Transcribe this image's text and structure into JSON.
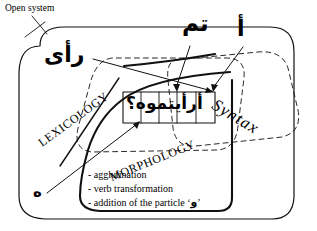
{
  "diagram": {
    "title_label": "Open system",
    "domains": {
      "lexicology": "LEXICOLOGY",
      "morphology": "MORPHOLOGY",
      "syntax": "Syntax"
    },
    "center_box": {
      "phrase": "أرأيتموه؟",
      "cells": [
        "؟",
        "ه",
        "مو",
        "أيت",
        "أر"
      ]
    },
    "arabic_annotations": {
      "ra_a": "رأى",
      "tamma": "تم",
      "alif": "أ",
      "hu": "ه"
    },
    "morphology_processes": [
      "- agglutination",
      "- verb transformation",
      "- addition of the particle "
    ],
    "particle_open_quote": "‘",
    "particle": "و",
    "particle_close_quote": "’",
    "colors": {
      "ink": "#000000",
      "background": "#ffffff"
    }
  }
}
